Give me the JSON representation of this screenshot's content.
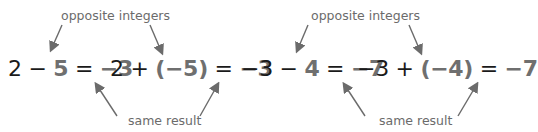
{
  "colors": {
    "text": "#1a1a1a",
    "highlight": "#6f6f6f",
    "annotation": "#6b6b6b",
    "arrow": "#6b6b6b"
  },
  "groups": [
    {
      "top_label": "opposite integers",
      "bottom_label": "same result",
      "equations": [
        {
          "parts": [
            "2",
            " − ",
            "5",
            " = ",
            "−3"
          ]
        },
        {
          "parts": [
            "2",
            " + ",
            "(−5)",
            " = ",
            "−3"
          ]
        }
      ]
    },
    {
      "top_label": "opposite integers",
      "bottom_label": "same result",
      "equations": [
        {
          "parts": [
            "−3",
            " − ",
            "4",
            " = ",
            "−7"
          ]
        },
        {
          "parts": [
            "−3",
            " + ",
            "(−4)",
            " = ",
            "−7"
          ]
        }
      ]
    }
  ]
}
